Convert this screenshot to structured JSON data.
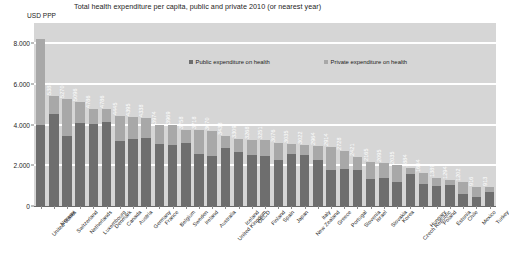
{
  "chart_data": {
    "type": "bar",
    "stacked": true,
    "title": "Total health expenditure per capita, public and private 2010 (or nearest year)",
    "ylabel": "USD PPP",
    "xlabel": "",
    "ylim": [
      0,
      9000
    ],
    "yticks": [
      0,
      2000,
      4000,
      6000,
      8000
    ],
    "ytick_labels": [
      "0",
      "2.000",
      "4.000",
      "6.000",
      "8.000"
    ],
    "grid": true,
    "legend_position": "inside-top-center",
    "legend": [
      {
        "name": "Public expenditure on health",
        "color": "#6e6e6e"
      },
      {
        "name": "Private expenditure on health",
        "color": "#a8a8a8"
      }
    ],
    "categories": [
      "United States",
      "Norway",
      "Switzerland",
      "Netherlands",
      "Luxembourg",
      "Denmark",
      "Canada",
      "Austria",
      "Germany",
      "France",
      "Belgium",
      "Sweden",
      "Ireland",
      "Australia",
      "United Kingdom",
      "Iceland",
      "OECD",
      "Finland",
      "Spain",
      "Japan",
      "New Zealand",
      "Italy",
      "Greece",
      "Portugal",
      "Slovenia",
      "Israel",
      "Slovakia",
      "Korea",
      "Czech Republic",
      "Hungary",
      "Poland",
      "Estonia",
      "Chile",
      "Mexico",
      "Turkey"
    ],
    "values": [
      8233,
      5388,
      5270,
      5096,
      4786,
      4786,
      4445,
      4395,
      4338,
      3974,
      3969,
      3758,
      3718,
      3670,
      3433,
      3309,
      3268,
      3251,
      3076,
      3035,
      3022,
      2964,
      2914,
      2728,
      2421,
      2165,
      2095,
      2035,
      1884,
      1604,
      1389,
      1294,
      1202,
      916,
      913
    ],
    "bar_labels": [
      "",
      "5388",
      "5270",
      "5096",
      "4786",
      "4786",
      "4445",
      "4395",
      "4338",
      "3974",
      "3969",
      "3758",
      "3718",
      "3670",
      "3433",
      "3309",
      "3268",
      "3251",
      "3076",
      "3035",
      "3022",
      "2964",
      "2914",
      "2728",
      "2421",
      "2165",
      "2095",
      "2035",
      "1884",
      "1604",
      "1389",
      "1294",
      "1202",
      "916",
      "913"
    ],
    "series": [
      {
        "name": "Public expenditure on health",
        "color": "#6e6e6e",
        "values": [
          3967,
          4503,
          3426,
          4094,
          4040,
          4148,
          3175,
          3281,
          3331,
          3061,
          2984,
          3100,
          2581,
          2453,
          2857,
          2652,
          2499,
          2472,
          2259,
          2540,
          2487,
          2286,
          1771,
          1832,
          1769,
          1320,
          1388,
          1161,
          1557,
          1059,
          980,
          1010,
          568,
          433,
          665
        ]
      },
      {
        "name": "Private expenditure on health",
        "color": "#a8a8a8",
        "values": [
          4266,
          885,
          1844,
          1002,
          746,
          638,
          1270,
          1114,
          1007,
          913,
          985,
          658,
          1137,
          1217,
          576,
          657,
          769,
          779,
          817,
          495,
          535,
          678,
          1143,
          896,
          652,
          845,
          707,
          874,
          327,
          545,
          409,
          284,
          634,
          483,
          248
        ]
      }
    ]
  }
}
